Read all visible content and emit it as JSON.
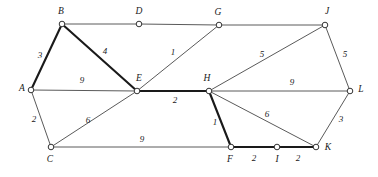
{
  "figure": {
    "type": "weighted-undirected-graph",
    "width": 378,
    "height": 177,
    "background": "#ffffff",
    "edge_color": "#5a5a5a",
    "highlight_color": "#1a1a1a",
    "node_fill": "#ffffff",
    "node_stroke": "#333333"
  },
  "nodes": [
    {
      "id": "A",
      "label": "A",
      "x": 31,
      "y": 90,
      "lx": 22,
      "ly": 89
    },
    {
      "id": "B",
      "label": "B",
      "x": 62,
      "y": 24,
      "lx": 61,
      "ly": 12
    },
    {
      "id": "C",
      "label": "C",
      "x": 51,
      "y": 147,
      "lx": 50,
      "ly": 160
    },
    {
      "id": "D",
      "label": "D",
      "x": 139,
      "y": 24,
      "lx": 139,
      "ly": 12
    },
    {
      "id": "E",
      "label": "E",
      "x": 137,
      "y": 91,
      "lx": 139,
      "ly": 79
    },
    {
      "id": "F",
      "label": "F",
      "x": 231,
      "y": 147,
      "lx": 230,
      "ly": 160
    },
    {
      "id": "G",
      "label": "G",
      "x": 219,
      "y": 25,
      "lx": 218,
      "ly": 13
    },
    {
      "id": "H",
      "label": "H",
      "x": 209,
      "y": 91,
      "lx": 207,
      "ly": 79
    },
    {
      "id": "I",
      "label": "I",
      "x": 277,
      "y": 147,
      "lx": 277,
      "ly": 160
    },
    {
      "id": "J",
      "label": "J",
      "x": 325,
      "y": 25,
      "lx": 327,
      "ly": 12
    },
    {
      "id": "K",
      "label": "K",
      "x": 316,
      "y": 147,
      "lx": 328,
      "ly": 148
    },
    {
      "id": "L",
      "label": "L",
      "x": 350,
      "y": 91,
      "lx": 361,
      "ly": 90
    }
  ],
  "edges": [
    {
      "from": "A",
      "to": "B",
      "weight": "3",
      "bold": true,
      "wx": 40,
      "wy": 56
    },
    {
      "from": "A",
      "to": "E",
      "weight": "9",
      "bold": false,
      "wx": 82,
      "wy": 81
    },
    {
      "from": "A",
      "to": "C",
      "weight": "2",
      "bold": false,
      "wx": 34,
      "wy": 120
    },
    {
      "from": "B",
      "to": "D",
      "weight": "",
      "bold": false,
      "wx": 0,
      "wy": 0
    },
    {
      "from": "B",
      "to": "E",
      "weight": "4",
      "bold": true,
      "wx": 105,
      "wy": 52
    },
    {
      "from": "C",
      "to": "E",
      "weight": "6",
      "bold": false,
      "wx": 88,
      "wy": 121
    },
    {
      "from": "C",
      "to": "F",
      "weight": "9",
      "bold": false,
      "wx": 142,
      "wy": 140
    },
    {
      "from": "D",
      "to": "G",
      "weight": "",
      "bold": false,
      "wx": 0,
      "wy": 0
    },
    {
      "from": "E",
      "to": "G",
      "weight": "1",
      "bold": false,
      "wx": 173,
      "wy": 53
    },
    {
      "from": "E",
      "to": "H",
      "weight": "2",
      "bold": true,
      "wx": 175,
      "wy": 101
    },
    {
      "from": "G",
      "to": "J",
      "weight": "",
      "bold": false,
      "wx": 0,
      "wy": 0
    },
    {
      "from": "H",
      "to": "J",
      "weight": "5",
      "bold": false,
      "wx": 262,
      "wy": 55
    },
    {
      "from": "H",
      "to": "L",
      "weight": "9",
      "bold": false,
      "wx": 292,
      "wy": 83
    },
    {
      "from": "H",
      "to": "F",
      "weight": "1",
      "bold": true,
      "wx": 215,
      "wy": 123
    },
    {
      "from": "H",
      "to": "K",
      "weight": "6",
      "bold": false,
      "wx": 267,
      "wy": 115
    },
    {
      "from": "J",
      "to": "L",
      "weight": "5",
      "bold": false,
      "wx": 345,
      "wy": 55
    },
    {
      "from": "K",
      "to": "L",
      "weight": "3",
      "bold": false,
      "wx": 341,
      "wy": 120
    },
    {
      "from": "F",
      "to": "I",
      "weight": "2",
      "bold": true,
      "wx": 254,
      "wy": 159
    },
    {
      "from": "I",
      "to": "K",
      "weight": "2",
      "bold": true,
      "wx": 298,
      "wy": 159
    }
  ]
}
